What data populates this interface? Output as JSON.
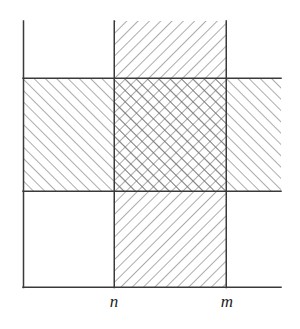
{
  "figure": {
    "background_color": "#ffffff",
    "line_color": "#3a3a3a",
    "hatch_color": "#6e6e6e",
    "label_color": "#1c1c1c",
    "width": 300,
    "height": 329
  },
  "axes": {
    "y_axis": {
      "name": "vertical-axis",
      "x": 23,
      "y_top": 21,
      "y_bottom": 287
    },
    "x_axis": {
      "name": "horizontal-axis",
      "y": 287,
      "x_left": 23,
      "x_right": 281
    }
  },
  "gridlines": {
    "vertical": [
      {
        "id": "n",
        "x": 114,
        "y_top": 21,
        "y_bottom": 287
      },
      {
        "id": "m",
        "x": 226,
        "y_top": 21,
        "y_bottom": 287
      }
    ],
    "horizontal": [
      {
        "id": "band-top",
        "y": 78,
        "x_left": 23,
        "x_right": 281
      },
      {
        "id": "band-bottom",
        "y": 191,
        "x_left": 23,
        "x_right": 281
      }
    ]
  },
  "regions": [
    {
      "id": "vertical-band",
      "label": "vertical strip between n and m",
      "x": 114,
      "y": 21,
      "width": 112,
      "height": 266,
      "hatch": "backslash",
      "hatch_angle_deg": -45,
      "hatch_spacing_px": 8
    },
    {
      "id": "horizontal-band",
      "label": "horizontal strip",
      "x": 23,
      "y": 78,
      "width": 258,
      "height": 113,
      "hatch": "slash",
      "hatch_angle_deg": 45,
      "hatch_spacing_px": 8
    },
    {
      "id": "intersection",
      "label": "crosshatched intersection of both strips",
      "x": 114,
      "y": 78,
      "width": 112,
      "height": 113,
      "hatch": "crosshatch",
      "hatch_angle_deg": 45,
      "hatch_spacing_px": 8
    }
  ],
  "tick_labels": [
    {
      "id": "n",
      "text": "n",
      "x": 114,
      "y": 303
    },
    {
      "id": "m",
      "text": "m",
      "x": 227,
      "y": 303
    }
  ]
}
